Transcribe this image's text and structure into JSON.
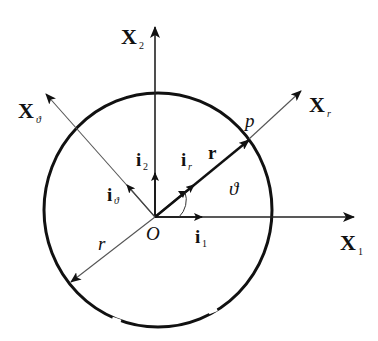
{
  "diagram": {
    "type": "polar-coordinate-system",
    "colors": {
      "stroke": "#111111",
      "thin": "#555555",
      "background": "#ffffff"
    },
    "axes": {
      "x1": {
        "label": "X",
        "sub": "1"
      },
      "x2": {
        "label": "X",
        "sub": "2"
      },
      "xr": {
        "label": "X",
        "sub": "r"
      },
      "xtheta": {
        "label": "X",
        "sub": "ϑ"
      }
    },
    "unit_vectors": {
      "i1": {
        "label": "i",
        "sub": "1"
      },
      "i2": {
        "label": "i",
        "sub": "2"
      },
      "ir": {
        "label": "i",
        "sub": "r"
      },
      "itheta": {
        "label": "i",
        "sub": "ϑ"
      }
    },
    "position_vector": {
      "label": "r"
    },
    "radius": {
      "label": "r"
    },
    "point": {
      "label": "p"
    },
    "origin": {
      "label": "O"
    },
    "angle": {
      "label": "ϑ"
    },
    "circle": {
      "cx": 158,
      "cy": 210,
      "rx": 114,
      "ry": 117
    }
  }
}
